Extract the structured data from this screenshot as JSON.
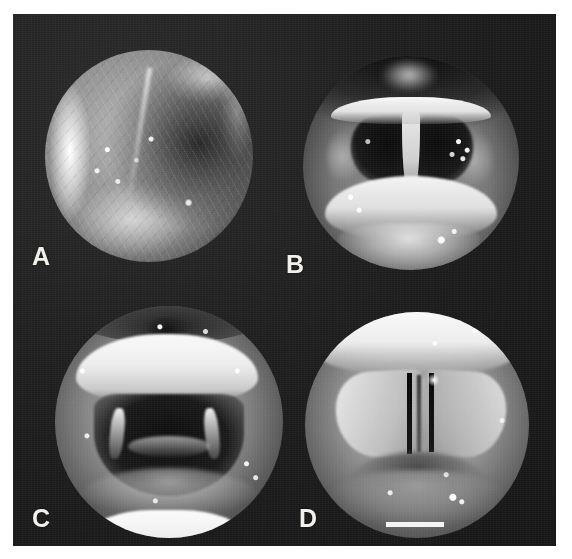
{
  "figure": {
    "type": "photographic-plate",
    "background_color": "#ffffff",
    "plate_color": "#1c1c1c",
    "label_color": "#f2f0ec",
    "panel_count": 4
  },
  "panels": [
    {
      "id": "a",
      "label": "A",
      "shape": "circle",
      "subject": "mucosal surface with bright rim highlight and vascular striations"
    },
    {
      "id": "b",
      "label": "B",
      "shape": "circle",
      "subject": "laryngeal inlet with bright epiglottis and dark paired glottic openings"
    },
    {
      "id": "c",
      "label": "C",
      "shape": "circle",
      "subject": "laryngoscopic view, overhanging epiglottis above dark glottic cavity"
    },
    {
      "id": "d",
      "label": "D",
      "shape": "circle",
      "subject": "vocal cords apposed with narrow dark glottic chink"
    }
  ]
}
